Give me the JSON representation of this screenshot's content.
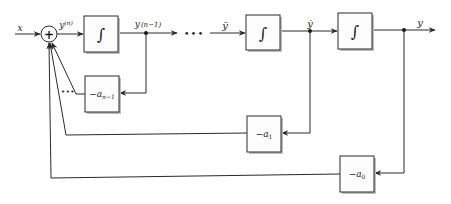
{
  "diagram": {
    "type": "block-diagram",
    "colors": {
      "line": "#2a2a2a",
      "block_fill": "#fdfdfd",
      "shadow": "#bdbdbd",
      "background": "#ffffff"
    },
    "input": {
      "label": "x"
    },
    "output": {
      "label": "y"
    },
    "summer": {
      "symbol": "+"
    },
    "signals": {
      "yn": {
        "label": "y",
        "sup": "(n)"
      },
      "yn1": {
        "label": "y",
        "sup": "(n−1)"
      },
      "yddot": {
        "label": "ÿ"
      },
      "ydot": {
        "label": "ẏ"
      },
      "y": {
        "label": "y"
      }
    },
    "ellipsis": "•••",
    "integrators": [
      {
        "id": "int1",
        "symbol": "∫"
      },
      {
        "id": "int2",
        "symbol": "∫"
      },
      {
        "id": "int3",
        "symbol": "∫"
      }
    ],
    "gains": [
      {
        "id": "gain-an1",
        "minus": "−",
        "coef": "a",
        "sub": "n−1"
      },
      {
        "id": "gain-a1",
        "minus": "−",
        "coef": "a",
        "sub": "1"
      },
      {
        "id": "gain-a0",
        "minus": "−",
        "coef": "a",
        "sub": "0"
      }
    ]
  }
}
